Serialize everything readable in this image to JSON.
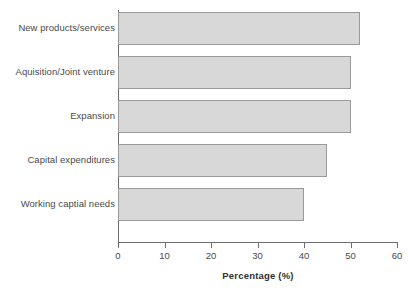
{
  "chart_data": {
    "type": "bar",
    "orientation": "horizontal",
    "title": "",
    "xlabel": "Percentage (%)",
    "ylabel": "",
    "xlim": [
      0,
      60
    ],
    "xticks": [
      0,
      10,
      20,
      30,
      40,
      50,
      60
    ],
    "xtick_labels": [
      "0",
      "10",
      "20",
      "30",
      "40",
      "50",
      "60"
    ],
    "grid": false,
    "legend": null,
    "categories": [
      "New products/services",
      "Aquisition/Joint venture",
      "Expansion",
      "Capital expenditures",
      "Working captial needs"
    ],
    "values": [
      52,
      50,
      50,
      45,
      40
    ],
    "bar_fill_color": "#d8d8d8",
    "bar_edge_color": "#9a9a9a",
    "axis_color": "#6d6d6d",
    "text_color": "#4a4a4a"
  }
}
